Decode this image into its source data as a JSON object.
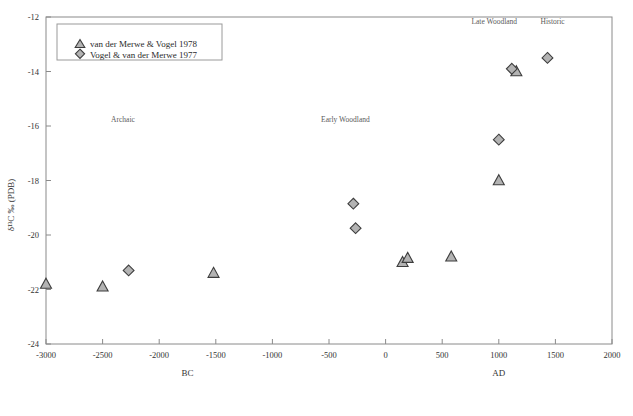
{
  "chart_data": {
    "type": "scatter",
    "title": "",
    "xlabel": "",
    "ylabel": "δ¹³C ‰ (PDB)",
    "xlim": [
      -3000,
      2000
    ],
    "ylim": [
      -24,
      -12
    ],
    "xticks": [
      -3000,
      -2500,
      -2000,
      -1500,
      -1000,
      -500,
      0,
      500,
      1000,
      1500,
      2000
    ],
    "xticklabels": [
      "-3000",
      "-2500",
      "-2000",
      "-1500",
      "-1000",
      "-500",
      "0",
      "500",
      "1000",
      "1500",
      "2000"
    ],
    "yticks": [
      -12,
      -14,
      -16,
      -18,
      -20,
      -22,
      -24
    ],
    "yticklabels": [
      "-12",
      "-14",
      "-16",
      "-18",
      "-20",
      "-22",
      "-24"
    ],
    "grid": false,
    "legend_position": "upper-left",
    "era_labels": [
      {
        "text": "BC",
        "x": -1750,
        "axis": "x"
      },
      {
        "text": "AD",
        "x": 1000,
        "axis": "x"
      }
    ],
    "annotations": [
      {
        "text": "Archaic",
        "x": -2320,
        "y": -15.85
      },
      {
        "text": "Early Woodland",
        "x": -355,
        "y": -15.85
      },
      {
        "text": "Late Woodland",
        "x": 960,
        "y": -12.25
      },
      {
        "text": "Historic",
        "x": 1475,
        "y": -12.25
      }
    ],
    "series": [
      {
        "name": "van der Merwe & Vogel 1978",
        "marker": "triangle",
        "color": "#b3b3b3",
        "edge_color": "#3d3d3d",
        "points": [
          {
            "x": -3000,
            "y": -21.8
          },
          {
            "x": -2500,
            "y": -21.9
          },
          {
            "x": -1520,
            "y": -21.4
          },
          {
            "x": 150,
            "y": -21.0
          },
          {
            "x": 195,
            "y": -20.85
          },
          {
            "x": 580,
            "y": -20.8
          },
          {
            "x": 1000,
            "y": -18.0
          },
          {
            "x": 1155,
            "y": -14.0
          }
        ]
      },
      {
        "name": "Vogel & van der Merwe 1977",
        "marker": "diamond",
        "color": "#b3b3b3",
        "edge_color": "#3d3d3d",
        "points": [
          {
            "x": -2270,
            "y": -21.3
          },
          {
            "x": -285,
            "y": -18.85
          },
          {
            "x": -265,
            "y": -19.75
          },
          {
            "x": 1000,
            "y": -16.5
          },
          {
            "x": 1115,
            "y": -13.9
          },
          {
            "x": 1430,
            "y": -13.5
          }
        ]
      }
    ]
  },
  "legend": {
    "entries": [
      {
        "label": "van der Merwe & Vogel 1978",
        "marker": "triangle"
      },
      {
        "label": "Vogel & van der Merwe 1977",
        "marker": "diamond"
      }
    ]
  },
  "caption": {
    "text": ""
  }
}
